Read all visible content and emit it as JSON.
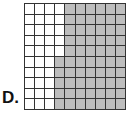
{
  "figure": {
    "label": "D.",
    "grid": {
      "rows": 10,
      "cols": 10,
      "shaded_color": "#bdbdbd",
      "unshaded_color": "#ffffff",
      "white_columns_per_row": [
        4,
        4,
        4,
        4,
        4,
        3,
        3,
        3,
        3,
        3
      ],
      "shaded_count": 65,
      "total_cells": 100
    }
  }
}
